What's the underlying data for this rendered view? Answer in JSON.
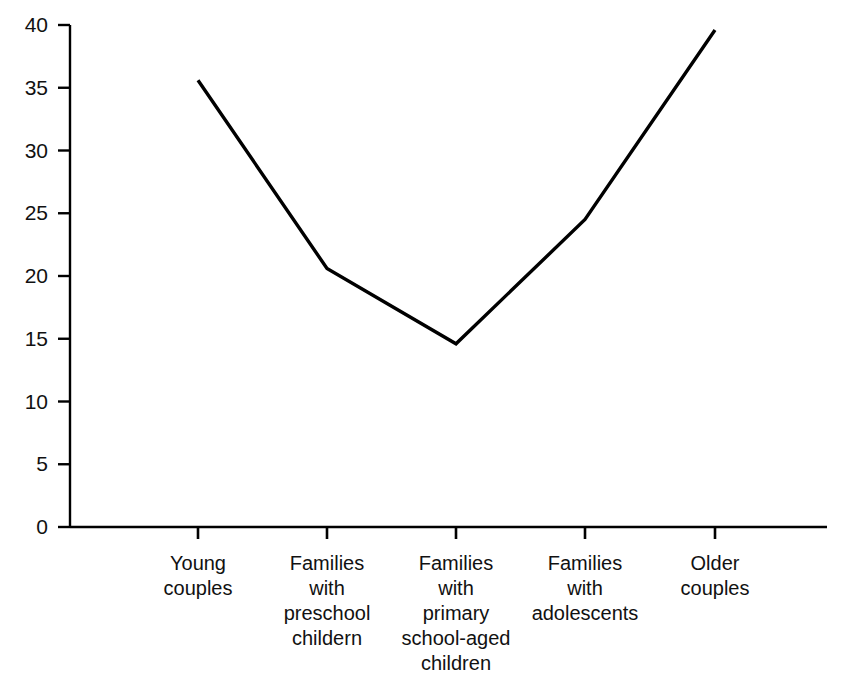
{
  "chart_data": {
    "type": "line",
    "title": "",
    "subtitle": "",
    "xlabel": "",
    "ylabel": "",
    "categories": [
      "Young couples",
      "Families with preschool childern",
      "Families with primary school-aged children",
      "Families with adolescents",
      "Older couples"
    ],
    "category_lines": [
      [
        "Young",
        "couples"
      ],
      [
        "Families",
        "with",
        "preschool",
        "childern"
      ],
      [
        "Families",
        "with",
        "primary",
        "school-aged",
        "children"
      ],
      [
        "Families",
        "with",
        "adolescents"
      ],
      [
        "Older",
        "couples"
      ]
    ],
    "values": [
      35.6,
      20.6,
      14.6,
      24.5,
      39.6
    ],
    "ylim": [
      0,
      40
    ],
    "ytick_values": [
      0,
      5,
      10,
      15,
      20,
      25,
      30,
      35,
      40
    ],
    "ytick_labels": [
      "0",
      "5",
      "10",
      "15",
      "20",
      "25",
      "30",
      "35",
      "40"
    ],
    "grid": false,
    "legend": false,
    "legend_position": "none",
    "line_color": "#000000",
    "axis_color": "#000000",
    "background_color": "#ffffff",
    "markers": false
  },
  "geometry": {
    "axis_x": 70,
    "axis_y0": 527,
    "axis_y_top": 25,
    "axis_x_end": 827,
    "tick_x": [
      198,
      327,
      456,
      585,
      715
    ],
    "value_px_per_unit": 12.55
  }
}
